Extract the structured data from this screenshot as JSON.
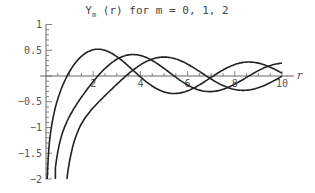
{
  "chart_data": {
    "type": "line",
    "title_parts": {
      "func": "Y",
      "sub": "m",
      "rest": " (r)  for m = 0, 1, 2"
    },
    "xlabel": "r",
    "ylabel": "",
    "xlim": [
      0,
      10
    ],
    "ylim": [
      -2,
      1
    ],
    "x_ticks": [
      2,
      4,
      6,
      8,
      10
    ],
    "x_tick_labels": [
      "2",
      "4",
      "6",
      "8",
      "10"
    ],
    "y_ticks": [
      1,
      0.5,
      -0.5,
      -1,
      -1.5,
      -2
    ],
    "y_tick_labels": [
      "1",
      "0.5",
      "−0.5",
      "−1",
      "−1.5",
      "−2"
    ],
    "grid": false,
    "legend": null,
    "series": [
      {
        "name": "Y0(r)",
        "x": [
          0.2,
          0.5,
          1,
          1.5,
          2,
          2.5,
          3,
          4,
          5,
          6,
          7,
          8,
          9,
          10
        ],
        "values": [
          -1.08,
          -0.44,
          0.09,
          0.38,
          0.51,
          0.5,
          0.38,
          -0.02,
          -0.31,
          -0.29,
          -0.03,
          0.22,
          0.25,
          0.06
        ]
      },
      {
        "name": "Y1(r)",
        "x": [
          0.5,
          1,
          1.5,
          2,
          2.5,
          3,
          3.7,
          4,
          5,
          6,
          7,
          8,
          9,
          10
        ],
        "values": [
          -1.47,
          -0.78,
          -0.41,
          -0.11,
          0.15,
          0.32,
          0.42,
          0.4,
          0.15,
          -0.18,
          -0.3,
          -0.16,
          0.1,
          0.25
        ]
      },
      {
        "name": "Y2(r)",
        "x": [
          1,
          1.5,
          2,
          2.5,
          3,
          4,
          5,
          5.2,
          6,
          7,
          8,
          9,
          10
        ],
        "values": [
          -1.65,
          -0.93,
          -0.62,
          -0.38,
          -0.16,
          0.22,
          0.37,
          0.37,
          0.23,
          -0.06,
          -0.26,
          -0.23,
          -0.01
        ]
      }
    ]
  }
}
